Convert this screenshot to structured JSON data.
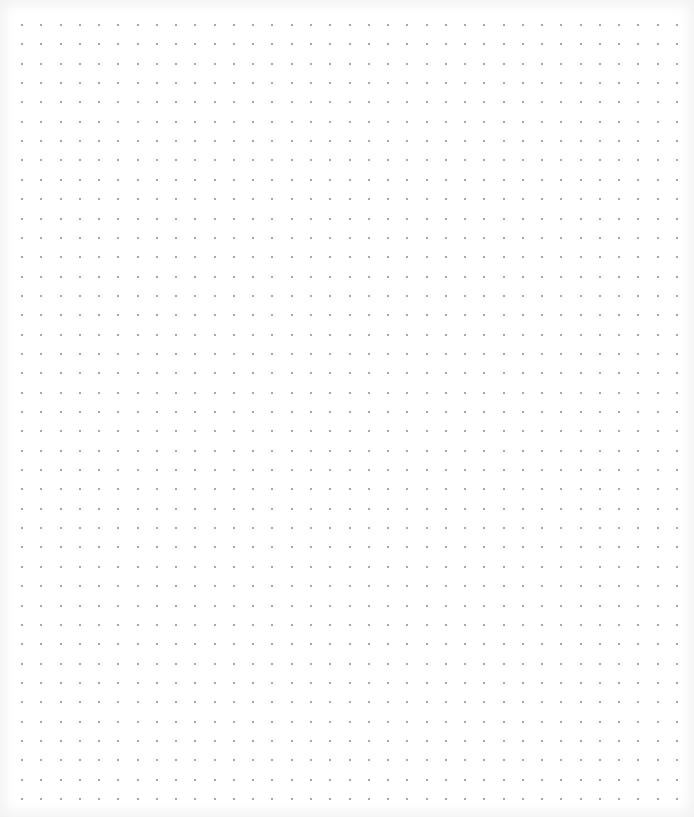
{
  "page": {
    "type": "dot-grid-paper",
    "background_color": "#ffffff",
    "dot_color": "#8a8a8a",
    "vignette_color": "#e8e8e8"
  },
  "grid": {
    "columns": 35,
    "rows": 41
  }
}
